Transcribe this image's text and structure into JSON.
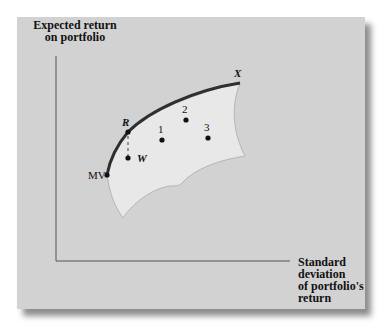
{
  "diagram": {
    "y_axis_label": [
      "Expected return",
      "on portfolio"
    ],
    "x_axis_label": [
      "Standard",
      "deviation",
      "of portfolio's",
      "return"
    ],
    "points": {
      "mv": {
        "label": "MV"
      },
      "r": {
        "label": "R"
      },
      "w": {
        "label": "W"
      },
      "x": {
        "label": "X"
      },
      "p1": {
        "label": "1"
      },
      "p2": {
        "label": "2"
      },
      "p3": {
        "label": "3"
      }
    },
    "colors": {
      "panel_bg": "#d2d2d2",
      "feasible_region": "#e8e8e8",
      "efficient_frontier": "#2f2f2f",
      "axes": "#555555"
    }
  }
}
